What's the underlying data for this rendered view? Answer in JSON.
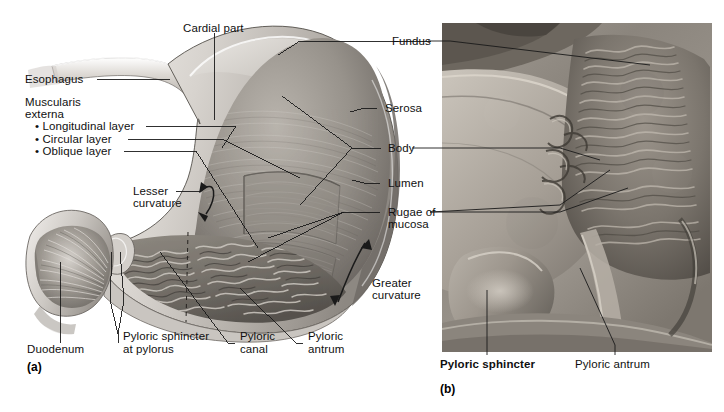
{
  "figure": {
    "panels": [
      {
        "letter": "(a)",
        "type": "illustration"
      },
      {
        "letter": "(b)",
        "type": "photograph"
      }
    ]
  },
  "panel_a": {
    "letter": "(a)",
    "labels": {
      "cardial_part": "Cardial part",
      "esophagus": "Esophagus",
      "muscularis_line1": "Muscularis",
      "muscularis_line2": "externa",
      "longitudinal_layer": "• Longitudinal layer",
      "circular_layer": "• Circular layer",
      "oblique_layer": "• Oblique layer",
      "lesser_curvature_line1": "Lesser",
      "lesser_curvature_line2": "curvature",
      "duodenum": "Duodenum",
      "pyloric_sphincter_line1": "Pyloric sphincter",
      "pyloric_sphincter_line2": "at pylorus",
      "pyloric_canal_line1": "Pyloric",
      "pyloric_canal_line2": "canal",
      "pyloric_antrum_line1": "Pyloric",
      "pyloric_antrum_line2": "antrum",
      "fundus": "Fundus",
      "serosa": "Serosa",
      "body": "Body",
      "lumen": "Lumen",
      "rugae_line1": "Rugae of",
      "rugae_line2": "mucosa",
      "greater_curvature_line1": "Greater",
      "greater_curvature_line2": "curvature"
    }
  },
  "panel_b": {
    "letter": "(b)",
    "labels": {
      "pyloric_sphincter": "Pyloric sphincter",
      "pyloric_antrum": "Pyloric antrum"
    }
  },
  "colors": {
    "background": "#ffffff",
    "text": "#101010",
    "leader_line": "#1a1a1a",
    "tissue_light": "#d8d4cf",
    "tissue_mid": "#9b968f",
    "tissue_dark": "#5c5853",
    "serosa": "#cfcbc6",
    "lumen_dark": "#4a4742",
    "photo_base": "#8f8b85"
  }
}
